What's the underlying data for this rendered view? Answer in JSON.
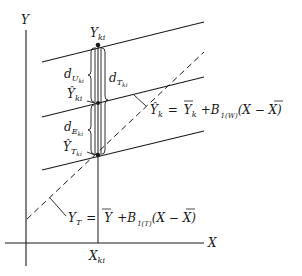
{
  "diagram": {
    "axes": {
      "y_label": "Y",
      "x_label": "X"
    },
    "point_labels": {
      "y_ki": {
        "base": "Y",
        "sub": "ki"
      },
      "y_hat_ki": {
        "base": "Ŷ",
        "sub": "ki"
      },
      "y_hat_t_ki": {
        "base": "Ŷ",
        "sub": "T",
        "subsub": "ki"
      },
      "x_ki": {
        "base": "X",
        "sub": "ki"
      }
    },
    "distances": {
      "d_u": {
        "base": "d",
        "sub": "U",
        "subsub": "ki"
      },
      "d_t": {
        "base": "d",
        "sub": "T",
        "subsub": "ki"
      },
      "d_e": {
        "base": "d",
        "sub": "E",
        "subsub": "ki"
      }
    },
    "equations": {
      "within": {
        "lhs_base": "Ŷ",
        "lhs_sub": "k",
        "eq": "=",
        "mean_base": "Y",
        "mean_sub": "k",
        "plus": "+B",
        "b_sub": "1(W)",
        "tail": "(X − X)"
      },
      "total": {
        "lhs_base": "Y",
        "lhs_sub": "T",
        "eq": "=",
        "mean_base": "Y",
        "plus": "+B",
        "b_sub": "1(T)",
        "tail": "(X − X)"
      }
    }
  }
}
